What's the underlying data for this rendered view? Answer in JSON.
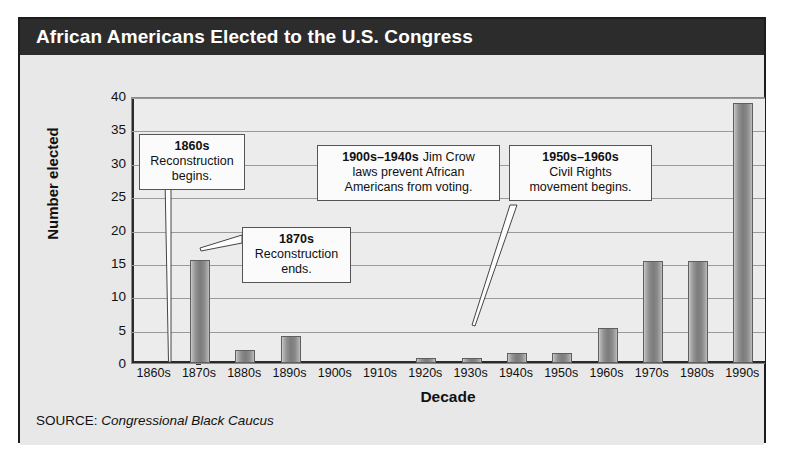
{
  "figure": {
    "title": "African Americans Elected to the U.S. Congress",
    "source_prefix": "SOURCE:",
    "source_name": "Congressional Black Caucus"
  },
  "chart_data": {
    "type": "bar",
    "title": "African Americans Elected to the U.S. Congress",
    "xlabel": "Decade",
    "ylabel": "Number elected",
    "ylim": [
      0,
      40
    ],
    "yticks": [
      0,
      5,
      10,
      15,
      20,
      25,
      30,
      35,
      40
    ],
    "grid": true,
    "legend": "none",
    "bar_color": "#8a8a8a",
    "categories": [
      "1860s",
      "1870s",
      "1880s",
      "1890s",
      "1900s",
      "1910s",
      "1920s",
      "1930s",
      "1940s",
      "1950s",
      "1960s",
      "1970s",
      "1980s",
      "1990s"
    ],
    "values": [
      0,
      15.5,
      2,
      4,
      0,
      0,
      0.8,
      0.8,
      1.5,
      1.5,
      5.3,
      15.3,
      15.3,
      39
    ],
    "annotations": [
      {
        "id": "ann-1860s",
        "bold": "1860s",
        "lines": [
          "Reconstruction",
          "begins."
        ],
        "points_to": "1860s"
      },
      {
        "id": "ann-1870s",
        "bold": "1870s",
        "lines": [
          "Reconstruction",
          "ends."
        ],
        "points_to": "1870s"
      },
      {
        "id": "ann-1900s-1940s",
        "bold": "1900s–1940s",
        "inline_first": "Jim Crow",
        "lines": [
          "laws prevent African",
          "Americans from voting."
        ],
        "points_to": "1900s–1940s"
      },
      {
        "id": "ann-1950s-1960s",
        "bold": "1950s–1960s",
        "lines": [
          "Civil Rights",
          "movement begins."
        ],
        "points_to": "1960s"
      }
    ]
  }
}
